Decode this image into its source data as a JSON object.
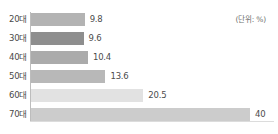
{
  "chart_data": {
    "type": "bar",
    "orientation": "horizontal",
    "title": "",
    "xlabel": "",
    "ylabel": "",
    "unit_note": "(단위: %)",
    "categories": [
      "20대",
      "30대",
      "40대",
      "50대",
      "60대",
      "70대"
    ],
    "values": [
      9.8,
      9.6,
      10.4,
      13.6,
      20.5,
      40
    ],
    "value_labels": [
      "9.8",
      "9.6",
      "10.4",
      "13.6",
      "20.5",
      "40"
    ],
    "bar_colors": [
      "#b3b3b3",
      "#8e8e8e",
      "#ababab",
      "#b8b8b8",
      "#e2e2e2",
      "#cccccc"
    ],
    "xlim": [
      0,
      40
    ],
    "grid": false,
    "legend": "none",
    "bars": [
      {
        "category": "20대",
        "value": 9.8,
        "label": "9.8",
        "color": "#b3b3b3"
      },
      {
        "category": "30대",
        "value": 9.6,
        "label": "9.6",
        "color": "#8e8e8e"
      },
      {
        "category": "40대",
        "value": 10.4,
        "label": "10.4",
        "color": "#ababab"
      },
      {
        "category": "50대",
        "value": 13.6,
        "label": "13.6",
        "color": "#b8b8b8"
      },
      {
        "category": "60대",
        "value": 20.5,
        "label": "20.5",
        "color": "#e2e2e2"
      },
      {
        "category": "70대",
        "value": 40,
        "label": "40",
        "color": "#cccccc"
      }
    ]
  }
}
